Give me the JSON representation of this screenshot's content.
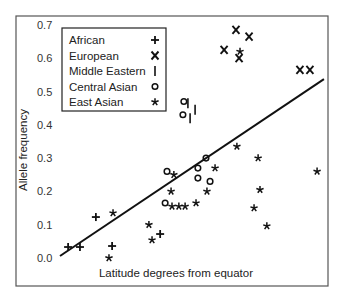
{
  "chart_data": {
    "type": "scatter",
    "title": "",
    "xlabel": "Latitude degrees from equator",
    "ylabel": "Allele frequency",
    "xlim": [
      0,
      100
    ],
    "ylim": [
      -0.08,
      0.73
    ],
    "x_ticks_shown": false,
    "y_ticks": [
      "0.0",
      "0.1",
      "0.2",
      "0.3",
      "0.4",
      "0.5",
      "0.6",
      "0.7"
    ],
    "y_tick_values": [
      0.0,
      0.1,
      0.2,
      0.3,
      0.4,
      0.5,
      0.6,
      0.7
    ],
    "grid": false,
    "legend_position": "upper left",
    "series": [
      {
        "name": "African",
        "symbol": "+",
        "points": [
          [
            16.7,
            0.033
          ],
          [
            20.5,
            0.033
          ],
          [
            25.6,
            0.123
          ],
          [
            30.8,
            0.036
          ],
          [
            46.2,
            0.072
          ]
        ]
      },
      {
        "name": "European",
        "symbol": "X",
        "points": [
          [
            70.5,
            0.685
          ],
          [
            74.7,
            0.665
          ],
          [
            66.7,
            0.625
          ],
          [
            71.5,
            0.6
          ],
          [
            91.0,
            0.565
          ],
          [
            94.2,
            0.565
          ]
        ]
      },
      {
        "name": "Middle Eastern",
        "symbol": "|",
        "points": [
          [
            55.1,
            0.465
          ],
          [
            57.4,
            0.445
          ],
          [
            55.8,
            0.42
          ]
        ]
      },
      {
        "name": "Central Asian",
        "symbol": "o",
        "points": [
          [
            53.8,
            0.47
          ],
          [
            53.5,
            0.43
          ],
          [
            48.4,
            0.26
          ],
          [
            58.3,
            0.27
          ],
          [
            58.3,
            0.24
          ],
          [
            60.9,
            0.3
          ],
          [
            62.2,
            0.23
          ],
          [
            47.8,
            0.165
          ]
        ]
      },
      {
        "name": "East Asian",
        "symbol": "*",
        "points": [
          [
            29.8,
            0.0
          ],
          [
            31.1,
            0.135
          ],
          [
            42.6,
            0.1
          ],
          [
            43.6,
            0.054
          ],
          [
            50.6,
            0.25
          ],
          [
            49.7,
            0.2
          ],
          [
            50.0,
            0.155
          ],
          [
            52.2,
            0.155
          ],
          [
            54.2,
            0.155
          ],
          [
            57.7,
            0.165
          ],
          [
            61.2,
            0.2
          ],
          [
            63.8,
            0.27
          ],
          [
            70.8,
            0.335
          ],
          [
            77.6,
            0.3
          ],
          [
            96.5,
            0.26
          ],
          [
            78.2,
            0.205
          ],
          [
            76.3,
            0.15
          ],
          [
            80.4,
            0.096
          ],
          [
            71.8,
            0.62
          ]
        ]
      }
    ],
    "regression_line": {
      "x": [
        14.1,
        98.7
      ],
      "y": [
        0.006,
        0.537
      ]
    }
  },
  "legend": {
    "items": [
      {
        "label": "African",
        "symbol": "+"
      },
      {
        "label": "European",
        "symbol": "X"
      },
      {
        "label": "Middle Eastern",
        "symbol": "|"
      },
      {
        "label": "Central Asian",
        "symbol": "o"
      },
      {
        "label": "East Asian",
        "symbol": "*"
      }
    ]
  },
  "axes": {
    "xlabel": "Latitude degrees from equator",
    "ylabel": "Allele frequency"
  }
}
